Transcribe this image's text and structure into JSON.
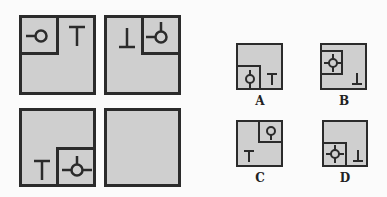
{
  "puzzle": {
    "grid_panels": [
      {
        "position": "top-left",
        "inner_square_corner": "top-left",
        "inner_symbol": "circle-with-left-stem",
        "outer_symbol": "T"
      },
      {
        "position": "top-right",
        "inner_square_corner": "top-right",
        "inner_symbol": "circle-with-left-and-top-stems",
        "outer_symbol": "inverted-T"
      },
      {
        "position": "bottom-left",
        "inner_square_corner": "bottom-right",
        "inner_symbol": "circle-with-left-right-top-stems",
        "outer_symbol": "T"
      },
      {
        "position": "bottom-right",
        "inner_square_corner": "none",
        "inner_symbol": "",
        "outer_symbol": "",
        "is_missing": true
      }
    ],
    "options": [
      {
        "label": "A",
        "inner_square_corner": "bottom-left",
        "inner_symbol": "circle-with-top-bottom-stems",
        "outer_symbol": "T"
      },
      {
        "label": "B",
        "inner_square_corner": "top-left",
        "inner_symbol": "circle-with-four-stems",
        "outer_symbol": "inverted-T"
      },
      {
        "label": "C",
        "inner_square_corner": "top-right",
        "inner_symbol": "circle-with-bottom-stem",
        "outer_symbol": "T"
      },
      {
        "label": "D",
        "inner_square_corner": "bottom-left",
        "inner_symbol": "circle-with-four-stems",
        "outer_symbol": "inverted-T"
      }
    ]
  },
  "colors": {
    "panel_fill": "#cfcfcf",
    "stroke": "#2b2b2b",
    "background": "#fbfbfb"
  }
}
